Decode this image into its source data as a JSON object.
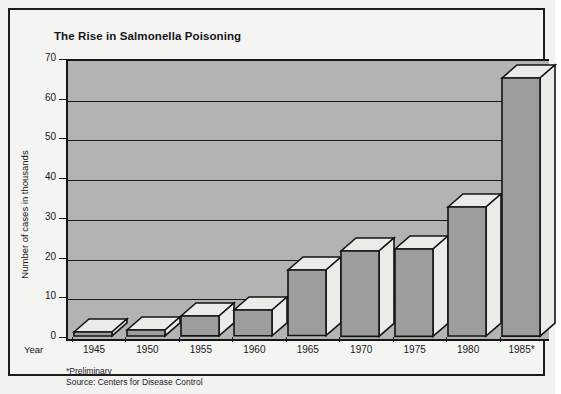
{
  "chart_data": {
    "type": "bar",
    "title": "The Rise in Salmonella Poisoning",
    "xlabel": "Year",
    "ylabel": "Number of cases in thousands",
    "categories": [
      "1945",
      "1950",
      "1955",
      "1960",
      "1965",
      "1970",
      "1975",
      "1980",
      "1985*"
    ],
    "values": [
      1,
      1.5,
      5,
      6.5,
      16.5,
      21.5,
      22,
      32.5,
      65
    ],
    "ylim": [
      0,
      70
    ],
    "yticks": [
      0,
      10,
      20,
      30,
      40,
      50,
      60,
      70
    ],
    "ytick_labels": [
      "0",
      "10",
      "20",
      "30",
      "40",
      "50",
      "60",
      "70"
    ],
    "grid": true,
    "legend": "none",
    "annotations": [
      "*Preliminary",
      "Source: Centers for Disease Control"
    ],
    "bar_style": "3d-isometric",
    "plot_background": "#b3b3b3",
    "bar_face_color": "#9d9d9d",
    "bar_highlight_color": "#ebebe7",
    "outline_color": "#141414"
  },
  "footnotes": {
    "preliminary": "*Preliminary",
    "source": "Source: Centers for Disease Control"
  },
  "axis": {
    "year_word": "Year"
  }
}
